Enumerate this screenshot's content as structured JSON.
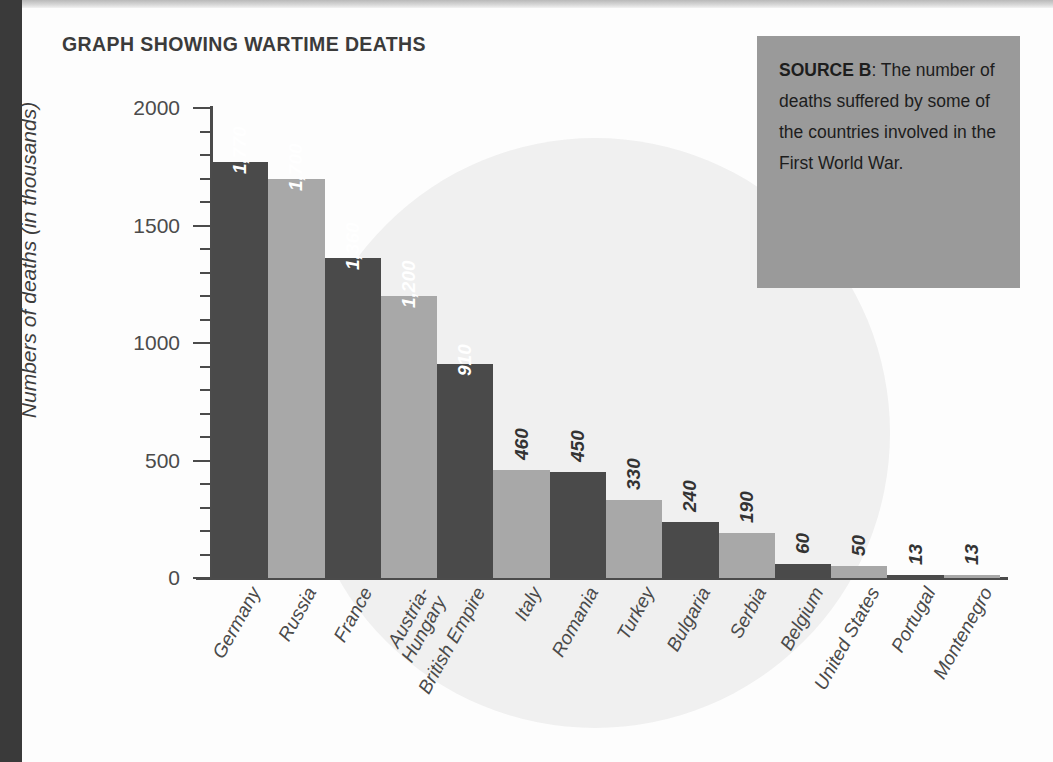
{
  "chart_title": "GRAPH SHOWING WARTIME DEATHS",
  "source_box": {
    "label": "SOURCE B",
    "separator": ": ",
    "text": "The number of deaths suffered by some of the countries involved in the First World War.",
    "background_color": "#9a9a9a"
  },
  "colors": {
    "bar_dark": "#4a4a4a",
    "bar_light": "#a8a8a8",
    "axis": "#4b4b4b",
    "page_background": "#fdfdfd",
    "backdrop_circle": "#f0f0f0",
    "edge_strip": "#3a3a3a",
    "label_inside": "#ffffff",
    "label_outside": "#333333"
  },
  "chart_data": {
    "type": "bar",
    "title": "GRAPH SHOWING WARTIME DEATHS",
    "xlabel": "",
    "ylabel": "Numbers of deaths (in thousands)",
    "ylim": [
      0,
      2000
    ],
    "ytick_major": [
      0,
      500,
      1000,
      1500,
      2000
    ],
    "ytick_major_labels": [
      "0",
      "500",
      "1000",
      "1500",
      "2000"
    ],
    "ytick_minor_step": 100,
    "grid": false,
    "legend": false,
    "categories": [
      "Germany",
      "Russia",
      "France",
      "Austria-Hungary",
      "British Empire",
      "Italy",
      "Romania",
      "Turkey",
      "Bulgaria",
      "Serbia",
      "Belgium",
      "United States",
      "Portugal",
      "Montenegro"
    ],
    "category_label_lines": [
      [
        "Germany"
      ],
      [
        "Russia"
      ],
      [
        "France"
      ],
      [
        "Austria-",
        "Hungary"
      ],
      [
        "British Empire"
      ],
      [
        "Italy"
      ],
      [
        "Romania"
      ],
      [
        "Turkey"
      ],
      [
        "Bulgaria"
      ],
      [
        "Serbia"
      ],
      [
        "Belgium"
      ],
      [
        "United States"
      ],
      [
        "Portugal"
      ],
      [
        "Montenegro"
      ]
    ],
    "values": [
      1770,
      1700,
      1360,
      1200,
      910,
      460,
      450,
      330,
      240,
      190,
      60,
      50,
      13,
      13
    ],
    "value_labels": [
      "1,770",
      "1,700",
      "1,360",
      "1,200",
      "910",
      "460",
      "450",
      "330",
      "240",
      "190",
      "60",
      "50",
      "13",
      "13"
    ],
    "label_placement": [
      "inside",
      "inside",
      "inside",
      "inside",
      "inside",
      "outside",
      "outside",
      "outside",
      "outside",
      "outside",
      "outside",
      "outside",
      "outside",
      "outside"
    ],
    "bar_colors": [
      "#4a4a4a",
      "#a8a8a8",
      "#4a4a4a",
      "#a8a8a8",
      "#4a4a4a",
      "#a8a8a8",
      "#4a4a4a",
      "#a8a8a8",
      "#4a4a4a",
      "#a8a8a8",
      "#4a4a4a",
      "#a8a8a8",
      "#4a4a4a",
      "#a8a8a8"
    ]
  }
}
